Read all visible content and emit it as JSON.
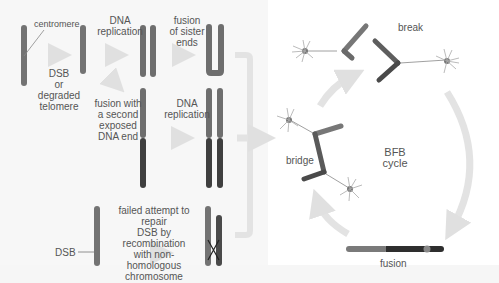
{
  "diagram": {
    "left_panel": {
      "labels": {
        "centromere": "centromere",
        "dsb_or_degraded": "DSB\nor\ndegraded\ntelomere",
        "dna_replication_1": "DNA\nreplication",
        "fusion_sister_ends": "fusion\nof sister\nends",
        "fusion_second_end": "fusion with\na second\nexposed\nDNA end",
        "dna_replication_2": "DNA\nreplication",
        "failed_attempt": "failed attempt to repair\nDSB by recombination\nwith non-homologous\nchromosome",
        "dsb": "DSB"
      }
    },
    "cycle": {
      "title": "BFB\ncycle",
      "stages": {
        "break": "break",
        "bridge": "bridge",
        "fusion": "fusion"
      }
    },
    "colors": {
      "chromosome_light": "#7a7a7a",
      "chromosome_mid": "#5e5e5e",
      "chromosome_dark": "#3a3a3a",
      "arrow": "#e0e0e0",
      "text": "#555555",
      "panel_bg": "#f7f7f7"
    }
  }
}
